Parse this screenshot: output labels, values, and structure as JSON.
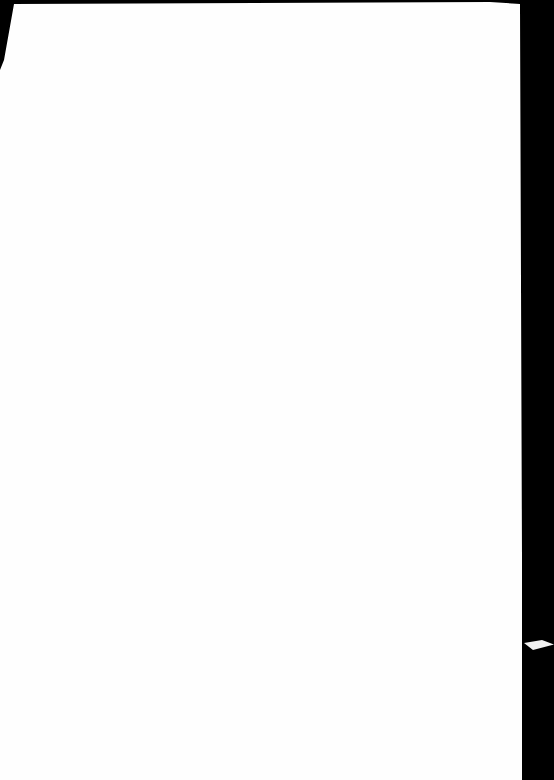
{
  "document": {
    "page_content": "",
    "background_color": "#000000",
    "paper_color": "#fefefe"
  }
}
